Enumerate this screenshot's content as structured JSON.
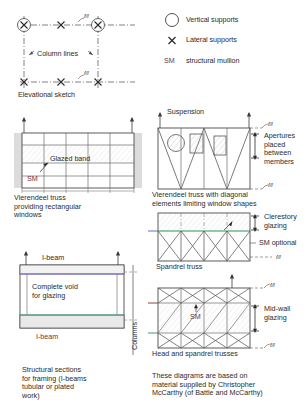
{
  "sheet": {
    "title": "Structural framing and glazing diagrams"
  },
  "legend": {
    "items": [
      {
        "symbol": "circle-icon",
        "label": "Vertical supports"
      },
      {
        "symbol": "cross-icon",
        "label": "Lateral supports"
      },
      {
        "symbol": "SM",
        "label": "structural mullion"
      }
    ]
  },
  "elevational": {
    "caption": "Elevational sketch",
    "column_lines_label": "Column lines",
    "fl_top": "f/l",
    "fl_bottom": "f/l"
  },
  "vierendeel_rect": {
    "glazed_band_label": "Glazed band",
    "sm_label": "SM",
    "caption": "Vierendeel truss\nproviding rectangular\nwindows"
  },
  "vierendeel_diag": {
    "suspension_label": "Suspension",
    "fl_top": "f/l",
    "fl_bottom": "f/l",
    "apertures_label": "Apertures\nplaced\nbetween\nmembers",
    "caption": "Vierendeel truss with diagonal\nelements limiting window shapes"
  },
  "spandrel": {
    "clerestory_label": "Clerestory\nglazing",
    "sm_optional_label": "SM optional",
    "fl_label": "f/l",
    "caption": "Spandrel truss"
  },
  "head_spandrel": {
    "fl_top": "f/l",
    "fl_bottom": "f/l",
    "sm_label": "SM",
    "midwall_label": "Mid-wall\nglazing",
    "caption": "Head and spandrel trusses"
  },
  "ibeam": {
    "top_label": "I-beam",
    "bottom_label": "I-beam",
    "void_label": "Complete void\nfor glazing",
    "columns_label": "Columns"
  },
  "footnotes": {
    "left": "Structural sections\nfor framing (I-beams\ntubular or plated\nwork)",
    "right": "These diagrams are based on\nmaterial supplied by Christopher\nMcCarthy (of Battle and McCarthy)"
  },
  "colors": {
    "line": "#3c3c3c",
    "dash": "#555555",
    "hatch": "#9a9a9a",
    "shade": "#d8d8d8",
    "green": "#2f8f5b",
    "purple": "#6a6ad0",
    "red": "#8b2f2f",
    "teal": "#3a9c86"
  }
}
